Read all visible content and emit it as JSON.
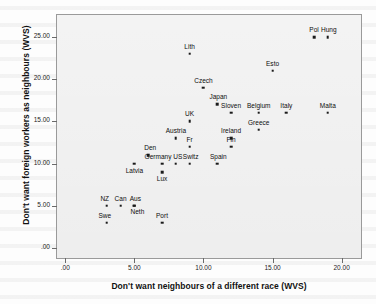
{
  "chart_data": {
    "type": "scatter",
    "title": "",
    "xlabel": "Don't want neighbours of a different race (WVS)",
    "ylabel": "Don't want foreign workers as neighbours (WVS)",
    "xlim": [
      -0.6,
      21.4
    ],
    "ylim": [
      -1.2,
      27.6
    ],
    "xticks": [
      0,
      5,
      10,
      15,
      20
    ],
    "xticklabels": [
      ".00",
      "5.00",
      "10.00",
      "15.00",
      "20.00"
    ],
    "yticks": [
      0,
      5,
      10,
      15,
      20,
      25
    ],
    "yticklabels": [
      ".00",
      "5.00",
      "10.00",
      "15.00",
      "20.00",
      "25.00"
    ],
    "grid": false,
    "legend": null,
    "points": [
      {
        "label": "Swe",
        "x": 3.0,
        "y": 3.0,
        "lx": 3.0,
        "ly": 3.0,
        "dx": -2,
        "dy": -4
      },
      {
        "label": "NZ",
        "x": 3.0,
        "y": 5.0,
        "lx": 3.0,
        "ly": 5.0,
        "dx": -2,
        "dy": -4
      },
      {
        "label": "Can",
        "x": 4.0,
        "y": 5.0,
        "lx": 4.0,
        "ly": 5.0,
        "dx": 0,
        "dy": -4
      },
      {
        "label": "Aus",
        "x": 5.0,
        "y": 5.0,
        "lx": 5.0,
        "ly": 5.0,
        "dx": 1,
        "dy": -4
      },
      {
        "label": "Neth",
        "x": 5.0,
        "y": 5.0,
        "lx": 5.0,
        "ly": 5.0,
        "dx": 3,
        "dy": 9
      },
      {
        "label": "Port",
        "x": 7.0,
        "y": 3.0,
        "lx": 7.0,
        "ly": 3.0,
        "dx": 0,
        "dy": -4
      },
      {
        "label": "Latvia",
        "x": 5.0,
        "y": 10.0,
        "lx": 5.0,
        "ly": 10.0,
        "dx": 0,
        "dy": 10
      },
      {
        "label": "Lux",
        "x": 7.0,
        "y": 9.0,
        "lx": 7.0,
        "ly": 9.0,
        "dx": 0,
        "dy": 10
      },
      {
        "label": "Den",
        "x": 6.0,
        "y": 11.0,
        "lx": 6.0,
        "ly": 11.0,
        "dx": 2,
        "dy": -4
      },
      {
        "label": "Germany",
        "x": 7.0,
        "y": 10.0,
        "lx": 7.0,
        "ly": 10.0,
        "dx": -4,
        "dy": -4
      },
      {
        "label": "US",
        "x": 8.0,
        "y": 10.0,
        "lx": 8.0,
        "ly": 10.0,
        "dx": 2,
        "dy": -4
      },
      {
        "label": "Switz",
        "x": 9.0,
        "y": 10.0,
        "lx": 9.0,
        "ly": 10.0,
        "dx": 1,
        "dy": -4
      },
      {
        "label": "Spain",
        "x": 11.0,
        "y": 10.0,
        "lx": 11.0,
        "ly": 10.0,
        "dx": 1,
        "dy": -4
      },
      {
        "label": "Fr",
        "x": 9.0,
        "y": 12.0,
        "lx": 9.0,
        "ly": 12.0,
        "dx": 0,
        "dy": -4
      },
      {
        "label": "Austria",
        "x": 8.0,
        "y": 13.0,
        "lx": 8.0,
        "ly": 13.0,
        "dx": 0,
        "dy": -4
      },
      {
        "label": "Fin",
        "x": 12.0,
        "y": 12.0,
        "lx": 12.0,
        "ly": 12.0,
        "dx": 0,
        "dy": -4
      },
      {
        "label": "Ireland",
        "x": 12.0,
        "y": 13.0,
        "lx": 12.0,
        "ly": 13.0,
        "dx": 0,
        "dy": -4
      },
      {
        "label": "Greece",
        "x": 14.0,
        "y": 14.0,
        "lx": 14.0,
        "ly": 14.0,
        "dx": 0,
        "dy": -4
      },
      {
        "label": "UK",
        "x": 9.0,
        "y": 15.0,
        "lx": 9.0,
        "ly": 15.0,
        "dx": 0,
        "dy": -4
      },
      {
        "label": "Sloven",
        "x": 12.0,
        "y": 16.0,
        "lx": 12.0,
        "ly": 16.0,
        "dx": 0,
        "dy": -4
      },
      {
        "label": "Belgium",
        "x": 14.0,
        "y": 16.0,
        "lx": 14.0,
        "ly": 16.0,
        "dx": 0,
        "dy": -4
      },
      {
        "label": "Italy",
        "x": 16.0,
        "y": 16.0,
        "lx": 16.0,
        "ly": 16.0,
        "dx": 0,
        "dy": -4
      },
      {
        "label": "Malta",
        "x": 19.0,
        "y": 16.0,
        "lx": 19.0,
        "ly": 16.0,
        "dx": 0,
        "dy": -4
      },
      {
        "label": "Japan",
        "x": 11.0,
        "y": 17.0,
        "lx": 11.0,
        "ly": 17.0,
        "dx": 1,
        "dy": -4
      },
      {
        "label": "Czech",
        "x": 10.0,
        "y": 19.0,
        "lx": 10.0,
        "ly": 19.0,
        "dx": 0,
        "dy": -4
      },
      {
        "label": "Esto",
        "x": 15.0,
        "y": 21.0,
        "lx": 15.0,
        "ly": 21.0,
        "dx": 0,
        "dy": -4
      },
      {
        "label": "Lith",
        "x": 9.0,
        "y": 23.0,
        "lx": 9.0,
        "ly": 23.0,
        "dx": 0,
        "dy": -4
      },
      {
        "label": "Pol",
        "x": 18.0,
        "y": 25.0,
        "lx": 18.0,
        "ly": 25.0,
        "dx": 0,
        "dy": -4
      },
      {
        "label": "Hung",
        "x": 19.0,
        "y": 25.0,
        "lx": 19.0,
        "ly": 25.0,
        "dx": 1,
        "dy": -4
      }
    ]
  },
  "figure": {
    "xlabel": "Don't want neighbours of a different race (WVS)",
    "ylabel": "Don't want foreign workers as neighbours (WVS)",
    "plot_bg": "#ededed",
    "frame_color": "#9a9a9a",
    "point_color": "#1a1a1a"
  }
}
